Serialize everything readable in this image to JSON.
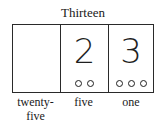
{
  "title": "Thirteen",
  "places": [
    {
      "label_line1": "twenty-",
      "label_line2": "five",
      "digit": "",
      "counters": 0
    },
    {
      "label_line1": "five",
      "label_line2": "",
      "digit": "2",
      "counters": 2
    },
    {
      "label_line1": "one",
      "label_line2": "",
      "digit": "3",
      "counters": 3
    }
  ],
  "colors": {
    "ink": "#1f1f1f",
    "background": "#ffffff"
  }
}
